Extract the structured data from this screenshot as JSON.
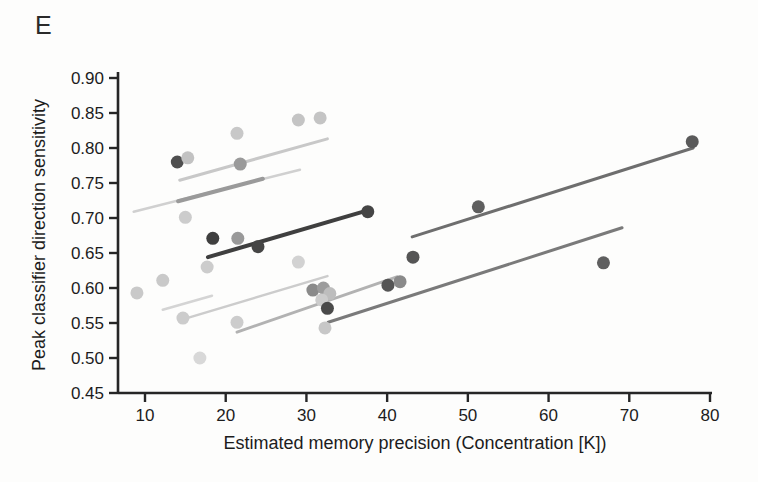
{
  "panel_label": "E",
  "colors": {
    "background": "#fdfdfc",
    "axis": "#262626",
    "text": "#1c1c1c"
  },
  "chart_data": {
    "type": "scatter",
    "title": "",
    "xlabel": "Estimated memory precision (Concentration [K])",
    "ylabel": "Peak classifier direction sensitivity",
    "xlim": [
      6.7,
      80
    ],
    "ylim": [
      0.45,
      0.9
    ],
    "xticks": [
      "10",
      "20",
      "30",
      "40",
      "50",
      "60",
      "70",
      "80"
    ],
    "yticks": [
      "0.45",
      "0.50",
      "0.55",
      "0.60",
      "0.65",
      "0.70",
      "0.75",
      "0.80",
      "0.85",
      "0.90"
    ],
    "grid": false,
    "legend": null,
    "marker_radius": 6.5,
    "points": [
      {
        "x": 14.0,
        "y": 0.78,
        "color": "#4f4f4f"
      },
      {
        "x": 15.3,
        "y": 0.786,
        "color": "#c2c2c2"
      },
      {
        "x": 21.8,
        "y": 0.777,
        "color": "#9a9a9a"
      },
      {
        "x": 21.4,
        "y": 0.821,
        "color": "#c8c8c8"
      },
      {
        "x": 29.0,
        "y": 0.84,
        "color": "#c4c4c4"
      },
      {
        "x": 31.7,
        "y": 0.843,
        "color": "#c4c4c4"
      },
      {
        "x": 15.0,
        "y": 0.701,
        "color": "#cccccc"
      },
      {
        "x": 18.4,
        "y": 0.671,
        "color": "#3f3f3f"
      },
      {
        "x": 21.5,
        "y": 0.671,
        "color": "#999999"
      },
      {
        "x": 24.0,
        "y": 0.659,
        "color": "#454545"
      },
      {
        "x": 37.6,
        "y": 0.709,
        "color": "#454545"
      },
      {
        "x": 17.7,
        "y": 0.63,
        "color": "#cccccc"
      },
      {
        "x": 29.0,
        "y": 0.637,
        "color": "#d2d2d2"
      },
      {
        "x": 9.0,
        "y": 0.593,
        "color": "#c9c9c9"
      },
      {
        "x": 12.2,
        "y": 0.611,
        "color": "#c9c9c9"
      },
      {
        "x": 14.7,
        "y": 0.557,
        "color": "#cccccc"
      },
      {
        "x": 21.4,
        "y": 0.551,
        "color": "#cccccc"
      },
      {
        "x": 16.8,
        "y": 0.5,
        "color": "#d8d8d8"
      },
      {
        "x": 30.8,
        "y": 0.597,
        "color": "#8a8a8a"
      },
      {
        "x": 32.1,
        "y": 0.6,
        "color": "#9c9c9c"
      },
      {
        "x": 32.9,
        "y": 0.592,
        "color": "#bdbdbd"
      },
      {
        "x": 31.9,
        "y": 0.583,
        "color": "#cccccc"
      },
      {
        "x": 32.6,
        "y": 0.571,
        "color": "#4a4a4a"
      },
      {
        "x": 32.3,
        "y": 0.543,
        "color": "#c7c7c7"
      },
      {
        "x": 40.1,
        "y": 0.604,
        "color": "#555555"
      },
      {
        "x": 41.6,
        "y": 0.609,
        "color": "#8a8a8a"
      },
      {
        "x": 43.2,
        "y": 0.644,
        "color": "#555555"
      },
      {
        "x": 51.3,
        "y": 0.716,
        "color": "#5f5f5f"
      },
      {
        "x": 66.8,
        "y": 0.636,
        "color": "#5f5f5f"
      },
      {
        "x": 77.8,
        "y": 0.809,
        "color": "#5a5a5a"
      }
    ],
    "regression_lines": [
      {
        "x1": 14.3,
        "y1": 0.754,
        "x2": 32.6,
        "y2": 0.813,
        "color": "#c8c8c8",
        "width": 3
      },
      {
        "x1": 8.6,
        "y1": 0.709,
        "x2": 29.2,
        "y2": 0.769,
        "color": "#d0d0d0",
        "width": 2.5
      },
      {
        "x1": 14.1,
        "y1": 0.724,
        "x2": 24.6,
        "y2": 0.756,
        "color": "#9a9a9a",
        "width": 4
      },
      {
        "x1": 17.8,
        "y1": 0.644,
        "x2": 37.9,
        "y2": 0.712,
        "color": "#3f3f3f",
        "width": 4
      },
      {
        "x1": 12.2,
        "y1": 0.569,
        "x2": 18.3,
        "y2": 0.589,
        "color": "#d4d4d4",
        "width": 2.5
      },
      {
        "x1": 15.2,
        "y1": 0.557,
        "x2": 32.6,
        "y2": 0.617,
        "color": "#cccccc",
        "width": 2.5
      },
      {
        "x1": 21.4,
        "y1": 0.537,
        "x2": 41.2,
        "y2": 0.616,
        "color": "#b2b2b2",
        "width": 3
      },
      {
        "x1": 32.7,
        "y1": 0.551,
        "x2": 69.1,
        "y2": 0.686,
        "color": "#7a7a7a",
        "width": 3
      },
      {
        "x1": 43.1,
        "y1": 0.673,
        "x2": 77.9,
        "y2": 0.8,
        "color": "#6e6e6e",
        "width": 3
      }
    ]
  }
}
